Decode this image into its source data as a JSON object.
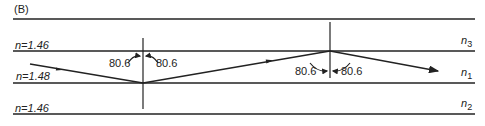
{
  "figure": {
    "panel_label": "(B)",
    "layers": [
      {
        "name": "top-cladding",
        "index_label": "n=1.46",
        "symbol": "n",
        "subscript": "3"
      },
      {
        "name": "core",
        "index_label": "n=1.48",
        "symbol": "n",
        "subscript": "1"
      },
      {
        "name": "bottom-cladding",
        "index_label": "n=1.46",
        "symbol": "n",
        "subscript": "2"
      }
    ],
    "angles": {
      "first_reflection": {
        "left": "80.6",
        "right": "80.6"
      },
      "second_reflection": {
        "left": "80.6",
        "right": "80.6"
      }
    },
    "colors": {
      "line": "#222222",
      "background": "#ffffff"
    }
  }
}
